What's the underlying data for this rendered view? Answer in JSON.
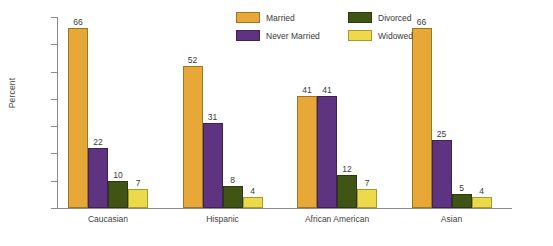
{
  "chart_data": {
    "type": "bar",
    "title": "",
    "xlabel": "",
    "ylabel": "Percent",
    "ylim": [
      0,
      70
    ],
    "yticks": [
      0,
      10,
      20,
      30,
      40,
      50,
      60,
      70
    ],
    "grid": false,
    "legend_position": "top-center",
    "categories": [
      "Caucasian",
      "Hispanic",
      "African American",
      "Asian"
    ],
    "series": [
      {
        "name": "Married",
        "color": "#E8A838",
        "values": [
          66,
          52,
          41,
          66
        ]
      },
      {
        "name": "Never Married",
        "color": "#5E3480",
        "values": [
          22,
          31,
          41,
          25
        ]
      },
      {
        "name": "Divorced",
        "color": "#3F5415",
        "values": [
          10,
          8,
          12,
          5
        ]
      },
      {
        "name": "Widowed",
        "color": "#EDDA4B",
        "values": [
          7,
          4,
          7,
          4
        ]
      }
    ]
  }
}
